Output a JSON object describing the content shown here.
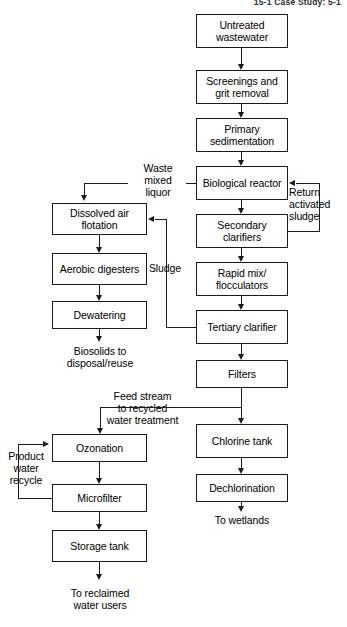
{
  "header": {
    "text": "15-1   Case Study: 5-1"
  },
  "diagram": {
    "boxes": [
      {
        "id": "untreated-wastewater",
        "label": "Untreated\nwastewater",
        "x": 196,
        "y": 14,
        "w": 92,
        "h": 34
      },
      {
        "id": "screenings-grit",
        "label": "Screenings and\ngrit removal",
        "x": 196,
        "y": 70,
        "w": 92,
        "h": 34
      },
      {
        "id": "primary-sedimentation",
        "label": "Primary\nsedimentation",
        "x": 196,
        "y": 118,
        "w": 92,
        "h": 34
      },
      {
        "id": "biological-reactor",
        "label": "Biological\nreactor",
        "x": 196,
        "y": 166,
        "w": 92,
        "h": 34
      },
      {
        "id": "secondary-clarifiers",
        "label": "Secondary\nclarifiers",
        "x": 196,
        "y": 214,
        "w": 92,
        "h": 34
      },
      {
        "id": "rapid-mix-flocculators",
        "label": "Rapid mix/\nflocculators",
        "x": 196,
        "y": 262,
        "w": 92,
        "h": 34
      },
      {
        "id": "tertiary-clarifier",
        "label": "Tertiary\nclarifier",
        "x": 196,
        "y": 310,
        "w": 92,
        "h": 34
      },
      {
        "id": "filters",
        "label": "Filters",
        "x": 196,
        "y": 360,
        "w": 92,
        "h": 28
      },
      {
        "id": "chlorine-tank",
        "label": "Chlorine\ntank",
        "x": 196,
        "y": 424,
        "w": 92,
        "h": 34
      },
      {
        "id": "dechlorination",
        "label": "Dechlorination",
        "x": 196,
        "y": 474,
        "w": 92,
        "h": 28
      },
      {
        "id": "dissolved-air-flotation",
        "label": "Dissolved air\nflotation",
        "x": 52,
        "y": 203,
        "w": 95,
        "h": 32
      },
      {
        "id": "aerobic-digesters",
        "label": "Aerobic\ndigesters",
        "x": 52,
        "y": 253,
        "w": 95,
        "h": 32
      },
      {
        "id": "dewatering",
        "label": "Dewatering",
        "x": 52,
        "y": 301,
        "w": 95,
        "h": 28
      },
      {
        "id": "ozonation",
        "label": "Ozonation",
        "x": 52,
        "y": 434,
        "w": 95,
        "h": 28
      },
      {
        "id": "microfilter",
        "label": "Microfilter",
        "x": 52,
        "y": 484,
        "w": 95,
        "h": 28
      },
      {
        "id": "storage-tank",
        "label": "Storage\ntank",
        "x": 52,
        "y": 530,
        "w": 95,
        "h": 32
      }
    ],
    "labels": [
      {
        "id": "waste-mixed-liquor",
        "text": "Waste\nmixed\nliquor",
        "x": 130,
        "y": 162,
        "w": 56,
        "align": "center"
      },
      {
        "id": "return-activated-sludge",
        "text": "Return\nactivated\nsludge",
        "x": 289,
        "y": 186,
        "w": 56,
        "align": "left"
      },
      {
        "id": "sludge",
        "text": "Sludge",
        "x": 140,
        "y": 262,
        "w": 50,
        "align": "center"
      },
      {
        "id": "biosolids-outlet",
        "text": "Biosolids to\ndisposal/reuse",
        "x": 42,
        "y": 345,
        "w": 116,
        "align": "center"
      },
      {
        "id": "feed-stream",
        "text": "Feed stream\nto recycled\nwater treatment",
        "x": 93,
        "y": 390,
        "w": 99,
        "align": "center"
      },
      {
        "id": "product-water-recycle",
        "text": "Product\nwater\nrecycle",
        "x": 1,
        "y": 450,
        "w": 50,
        "align": "center"
      },
      {
        "id": "to-wetlands",
        "text": "To wetlands",
        "x": 192,
        "y": 514,
        "w": 100,
        "align": "center"
      },
      {
        "id": "to-reclaimed-users",
        "text": "To reclaimed\nwater users",
        "x": 44,
        "y": 587,
        "w": 112,
        "align": "center"
      }
    ]
  }
}
